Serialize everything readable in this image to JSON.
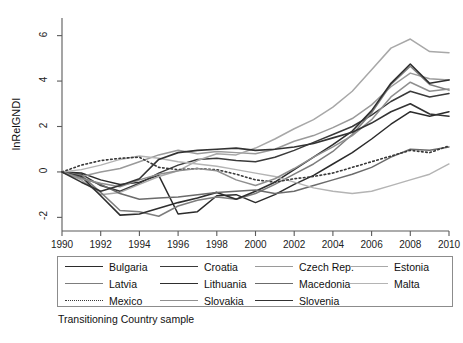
{
  "chart_data": {
    "type": "line",
    "title": "",
    "caption": "Transitioning Country sample",
    "xlabel": "",
    "ylabel": "lnRelGNDI",
    "grid": false,
    "legend_position": "bottom",
    "xlim": [
      1990,
      2010
    ],
    "ylim": [
      -2.6,
      6.6
    ],
    "xticks": [
      1990,
      1992,
      1994,
      1996,
      1998,
      2000,
      2002,
      2004,
      2006,
      2008,
      2010
    ],
    "yticks": [
      -2,
      0,
      2,
      4,
      6
    ],
    "xtick_labels": [
      "1990",
      "1992",
      "1994",
      "1996",
      "1998",
      "2000",
      "2002",
      "2004",
      "2006",
      "2008",
      "2010"
    ],
    "ytick_labels": [
      "-2",
      "0",
      "2",
      "4",
      "6"
    ],
    "x": [
      1990,
      1991,
      1992,
      1993,
      1994,
      1995,
      1996,
      1997,
      1998,
      1999,
      2000,
      2001,
      2002,
      2003,
      2004,
      2005,
      2006,
      2007,
      2008,
      2009,
      2010
    ],
    "series": [
      {
        "name": "Bulgaria",
        "color": "#2b2b2b",
        "style": "solid",
        "width": 1.5,
        "values": [
          0.0,
          -0.05,
          -0.35,
          -0.55,
          -0.45,
          -0.15,
          -1.85,
          -1.75,
          -1.05,
          -1.0,
          -1.35,
          -1.0,
          -0.55,
          -0.15,
          0.35,
          0.85,
          1.45,
          2.1,
          2.65,
          2.45,
          2.65
        ]
      },
      {
        "name": "Croatia",
        "color": "#3a3a3a",
        "style": "solid",
        "width": 1.5,
        "values": [
          0.0,
          -0.1,
          -0.6,
          -0.85,
          -0.5,
          -0.05,
          0.3,
          0.55,
          0.6,
          0.5,
          0.45,
          0.65,
          0.95,
          1.3,
          1.65,
          2.0,
          2.5,
          3.1,
          3.55,
          3.3,
          3.45
        ]
      },
      {
        "name": "Czech Rep.",
        "color": "#9a9a9a",
        "style": "solid",
        "width": 1.5,
        "values": [
          0.0,
          -0.2,
          0.0,
          0.15,
          0.45,
          0.75,
          0.95,
          0.8,
          0.9,
          0.85,
          0.8,
          1.0,
          1.35,
          1.6,
          1.95,
          2.35,
          2.95,
          3.75,
          4.35,
          4.1,
          4.05
        ]
      },
      {
        "name": "Estonia",
        "color": "#a8a8a8",
        "style": "solid",
        "width": 1.5,
        "values": [
          0.0,
          -0.35,
          -1.0,
          -0.9,
          -0.55,
          -0.2,
          0.05,
          0.5,
          0.8,
          0.75,
          1.05,
          1.45,
          1.9,
          2.3,
          2.85,
          3.55,
          4.5,
          5.45,
          5.85,
          5.3,
          5.25
        ]
      },
      {
        "name": "Latvia",
        "color": "#7d7d7d",
        "style": "solid",
        "width": 1.5,
        "values": [
          0.0,
          -0.15,
          -0.9,
          -1.7,
          -1.75,
          -1.95,
          -1.5,
          -1.25,
          -1.1,
          -1.2,
          -0.95,
          -0.55,
          -0.1,
          0.35,
          0.9,
          1.65,
          2.6,
          3.85,
          4.65,
          3.85,
          3.6
        ]
      },
      {
        "name": "Lithuania",
        "color": "#2e2e2e",
        "style": "solid",
        "width": 1.6,
        "values": [
          0.0,
          -0.2,
          -1.05,
          -1.9,
          -1.85,
          -1.6,
          -1.35,
          -1.15,
          -0.9,
          -1.2,
          -0.85,
          -0.45,
          0.1,
          0.65,
          1.2,
          1.8,
          2.7,
          3.9,
          4.75,
          3.9,
          4.05
        ]
      },
      {
        "name": "Macedonia",
        "color": "#6b6b6b",
        "style": "solid",
        "width": 1.5,
        "values": [
          0.0,
          -0.25,
          -0.55,
          -0.95,
          -1.2,
          -1.15,
          -1.1,
          -1.0,
          -0.9,
          -0.85,
          -0.8,
          -0.95,
          -0.85,
          -0.6,
          -0.35,
          -0.1,
          0.2,
          0.65,
          1.0,
          0.95,
          1.1
        ]
      },
      {
        "name": "Malta",
        "color": "#b4b4b4",
        "style": "solid",
        "width": 1.4,
        "values": [
          0.0,
          0.1,
          0.3,
          0.55,
          0.7,
          0.6,
          0.45,
          0.35,
          0.25,
          0.1,
          -0.05,
          -0.2,
          -0.45,
          -0.7,
          -0.85,
          -0.95,
          -0.85,
          -0.6,
          -0.35,
          -0.1,
          0.35
        ]
      },
      {
        "name": "Mexico",
        "color": "#383838",
        "style": "dotted",
        "width": 1.6,
        "values": [
          0.0,
          0.3,
          0.5,
          0.6,
          0.65,
          0.2,
          0.1,
          0.15,
          0.1,
          -0.1,
          -0.35,
          -0.45,
          -0.3,
          -0.2,
          -0.05,
          0.2,
          0.45,
          0.7,
          0.95,
          0.85,
          1.15
        ]
      },
      {
        "name": "Slovakia",
        "color": "#8f8f8f",
        "style": "solid",
        "width": 1.5,
        "values": [
          0.0,
          -0.3,
          -0.5,
          -0.65,
          -0.35,
          -0.1,
          0.05,
          0.15,
          0.05,
          -0.35,
          -0.6,
          -0.3,
          0.15,
          0.65,
          1.1,
          1.6,
          2.3,
          3.3,
          3.95,
          3.55,
          3.65
        ]
      },
      {
        "name": "Slovenia",
        "color": "#333333",
        "style": "solid",
        "width": 1.6,
        "values": [
          0.0,
          -0.45,
          -0.85,
          -0.6,
          -0.3,
          0.55,
          0.85,
          0.95,
          1.0,
          1.05,
          0.95,
          1.0,
          1.1,
          1.25,
          1.5,
          1.75,
          2.15,
          2.65,
          3.0,
          2.55,
          2.45
        ]
      }
    ]
  },
  "legend": {
    "rows": [
      [
        {
          "label": "Bulgaria",
          "series": 0
        },
        {
          "label": "Croatia",
          "series": 1
        },
        {
          "label": "Czech Rep.",
          "series": 2
        },
        {
          "label": "Estonia",
          "series": 3
        }
      ],
      [
        {
          "label": "Latvia",
          "series": 4
        },
        {
          "label": "Lithuania",
          "series": 5
        },
        {
          "label": "Macedonia",
          "series": 6
        },
        {
          "label": "Malta",
          "series": 7
        }
      ],
      [
        {
          "label": "Mexico",
          "series": 8
        },
        {
          "label": "Slovakia",
          "series": 9
        },
        {
          "label": "Slovenia",
          "series": 10
        }
      ]
    ]
  }
}
